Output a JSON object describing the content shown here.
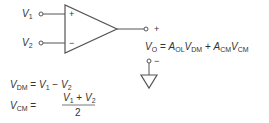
{
  "diagram": {
    "inputs": [
      {
        "name": "V",
        "sub": "1",
        "pin": "+"
      },
      {
        "name": "V",
        "sub": "2",
        "pin": "−"
      }
    ],
    "output_terminals": {
      "plus": "+",
      "minus": "−"
    },
    "equations": {
      "vo": {
        "lhs": "V",
        "lhs_sub": "O",
        "eq": "=",
        "t1": "A",
        "t1_sub": "OL",
        "t2": "V",
        "t2_sub": "DM",
        "plus": "+",
        "t3": "A",
        "t3_sub": "CM",
        "t4": "V",
        "t4_sub": "CM"
      },
      "vdm": {
        "lhs": "V",
        "lhs_sub": "DM",
        "eq": "=",
        "a": "V",
        "a_sub": "1",
        "minus": "−",
        "b": "V",
        "b_sub": "2"
      },
      "vcm": {
        "lhs": "V",
        "lhs_sub": "CM",
        "eq": "=",
        "a": "V",
        "a_sub": "1",
        "plus": "+",
        "b": "V",
        "b_sub": "2",
        "den": "2"
      }
    },
    "colors": {
      "stroke": "#555555",
      "text": "#333333"
    }
  }
}
